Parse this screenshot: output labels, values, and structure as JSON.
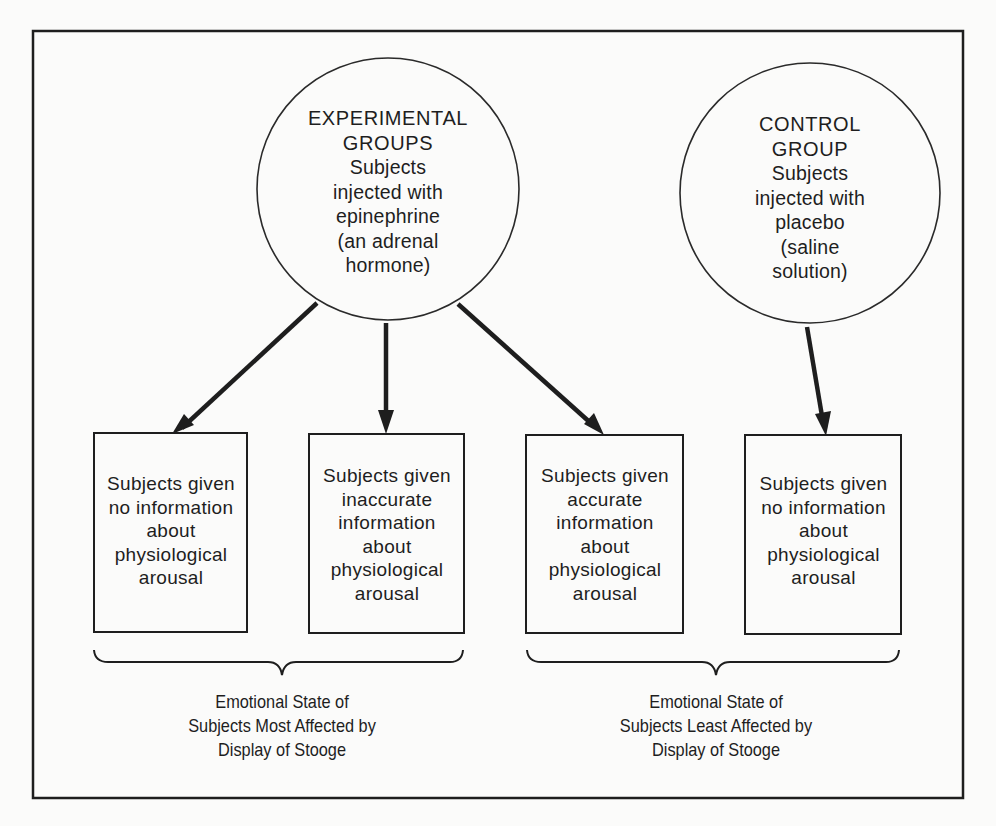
{
  "diagram": {
    "groups": [
      {
        "id": "experimental",
        "title_lines": [
          "EXPERIMENTAL",
          "GROUPS"
        ],
        "body_lines": [
          "Subjects",
          "injected with",
          "epinephrine",
          "(an adrenal",
          "hormone)"
        ]
      },
      {
        "id": "control",
        "title_lines": [
          "CONTROL",
          "GROUP"
        ],
        "body_lines": [
          "Subjects",
          "injected with",
          "placebo",
          "(saline",
          "solution)"
        ]
      }
    ],
    "conditions": [
      {
        "from": "experimental",
        "lines": [
          "Subjects given",
          "no information",
          "about",
          "physiological",
          "arousal"
        ]
      },
      {
        "from": "experimental",
        "lines": [
          "Subjects given",
          "inaccurate",
          "information",
          "about",
          "physiological",
          "arousal"
        ]
      },
      {
        "from": "experimental",
        "lines": [
          "Subjects given",
          "accurate",
          "information",
          "about",
          "physiological",
          "arousal"
        ]
      },
      {
        "from": "control",
        "lines": [
          "Subjects given",
          "no information",
          "about",
          "physiological",
          "arousal"
        ]
      }
    ],
    "outcomes": [
      {
        "groups_conditions": [
          0,
          1
        ],
        "lines": [
          "Emotional State of",
          "Subjects Most Affected by",
          "Display of Stooge"
        ]
      },
      {
        "groups_conditions": [
          2,
          3
        ],
        "lines": [
          "Emotional State of",
          "Subjects Least Affected by",
          "Display of Stooge"
        ]
      }
    ],
    "colors": {
      "ink": "#1e1e1e",
      "paper": "#fbfbfa"
    }
  }
}
